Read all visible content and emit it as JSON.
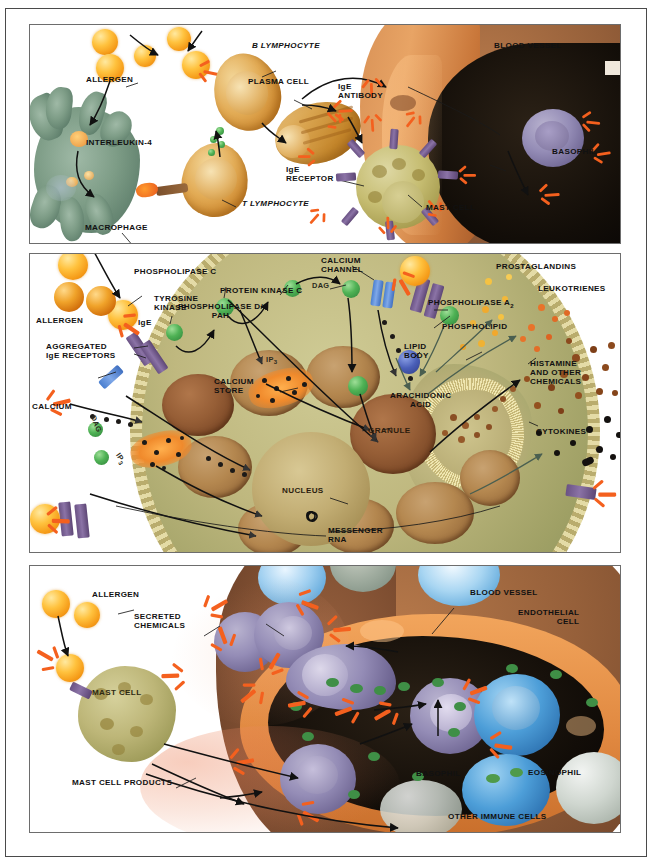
{
  "figure": {
    "type": "three-panel-scientific-illustration"
  },
  "colors": {
    "allergen": "#ffc23e",
    "ige_antibody": "#f4601e",
    "ige_receptor": "#6a5284",
    "macrophage": "#7d9c86",
    "lymphocyte": "#e2ab55",
    "mast_cell": "#c6bd72",
    "basophil": "#948cb6",
    "eosinophil": "#4d9ed8",
    "blood_vessel": "#96603a",
    "endothelium": "#e08840",
    "granule": "#965e36",
    "frame": "#4a4a4a"
  },
  "panel1": {
    "labels": [
      {
        "id": "allergen",
        "text": "ALLERGEN",
        "italic": false
      },
      {
        "id": "interleukin4",
        "text": "INTERLEUKIN-4",
        "italic": false
      },
      {
        "id": "macrophage",
        "text": "MACROPHAGE",
        "italic": false
      },
      {
        "id": "b-lymphocyte",
        "text": "B LYMPHOCYTE",
        "italic": true
      },
      {
        "id": "t-lymphocyte",
        "text": "T LYMPHOCYTE",
        "italic": true
      },
      {
        "id": "plasma-cell",
        "text": "PLASMA CELL",
        "italic": false
      },
      {
        "id": "ige-antibody",
        "text": "IgE\nANTIBODY",
        "line1": "IgE",
        "line2": "ANTIBODY"
      },
      {
        "id": "ige-receptor",
        "text": "IgE\nRECEPTOR",
        "line1": "IgE",
        "line2": "RECEPTOR"
      },
      {
        "id": "mast-cell",
        "text": "MAST CELL",
        "italic": false
      },
      {
        "id": "blood-vessel",
        "text": "BLOOD VESSEL",
        "italic": false
      },
      {
        "id": "basophil",
        "text": "BASOPHIL",
        "italic": false
      }
    ]
  },
  "panel2": {
    "labels": [
      {
        "id": "allergen",
        "text": "ALLERGEN"
      },
      {
        "id": "ige",
        "text": "IgE"
      },
      {
        "id": "aggregated-receptors",
        "line1": "AGGREGATED",
        "line2": "IgE RECEPTORS"
      },
      {
        "id": "calcium",
        "text": "CALCIUM"
      },
      {
        "id": "tyrosine-kinase",
        "line1": "TYROSINE",
        "line2": "KINASE"
      },
      {
        "id": "phospholipase-c",
        "text": "PHOSPHOLIPASE C"
      },
      {
        "id": "protein-kinase-c",
        "text": "PROTEIN KINASE C"
      },
      {
        "id": "phospholipase-d-pah",
        "line1": "PHOSPHOLIPASE D/",
        "line2": "PAH"
      },
      {
        "id": "calcium-channel",
        "line1": "CALCIUM",
        "line2": "CHANNEL"
      },
      {
        "id": "phospholipase-a2",
        "text": "PHOSPHOLIPASE A",
        "subscript": "2"
      },
      {
        "id": "phospholipid",
        "text": "PHOSPHOLIPID"
      },
      {
        "id": "lipid-body",
        "line1": "LIPID",
        "line2": "BODY"
      },
      {
        "id": "calcium-store",
        "line1": "CALCIUM",
        "line2": "STORE"
      },
      {
        "id": "dag-1",
        "text": "DAG"
      },
      {
        "id": "dag-2",
        "text": "DAG"
      },
      {
        "id": "ip3-1",
        "text": "IP",
        "subscript": "3"
      },
      {
        "id": "ip3-2",
        "text": "IP",
        "subscript": "3"
      },
      {
        "id": "arachidonic-acid",
        "line1": "ARACHIDONIC",
        "line2": "ACID"
      },
      {
        "id": "granule",
        "text": "GRANULE"
      },
      {
        "id": "nucleus",
        "text": "NUCLEUS"
      },
      {
        "id": "messenger-rna",
        "line1": "MESSENGER",
        "line2": "RNA"
      },
      {
        "id": "prostaglandins",
        "text": "PROSTAGLANDINS"
      },
      {
        "id": "leukotrienes",
        "text": "LEUKOTRIENES"
      },
      {
        "id": "histamine",
        "line1": "HISTAMINE",
        "line2": "AND OTHER",
        "line3": "CHEMICALS"
      },
      {
        "id": "cytokines",
        "text": "CYTOKINES"
      }
    ]
  },
  "panel3": {
    "labels": [
      {
        "id": "allergen",
        "text": "ALLERGEN"
      },
      {
        "id": "secreted-chemicals",
        "line1": "SECRETED",
        "line2": "CHEMICALS"
      },
      {
        "id": "mast-cell",
        "text": "MAST CELL"
      },
      {
        "id": "mast-cell-products",
        "text": "MAST CELL PRODUCTS"
      },
      {
        "id": "blood-vessel",
        "text": "BLOOD VESSEL"
      },
      {
        "id": "endothelial-cell",
        "line1": "ENDOTHELIAL",
        "line2": "CELL"
      },
      {
        "id": "basophil",
        "text": "BASOPHIL"
      },
      {
        "id": "eosinophil",
        "text": "EOSINOPHIL"
      },
      {
        "id": "other-immune-cells",
        "text": "OTHER IMMUNE CELLS"
      }
    ]
  }
}
